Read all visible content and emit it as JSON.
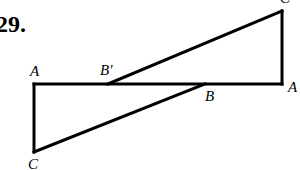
{
  "problem_number": "29.",
  "labels": {
    "a_left": "A",
    "b_prime": "B′",
    "c_top": "C",
    "b": "B",
    "a_right": "A",
    "c_bottom": "C"
  },
  "stroke_color": "#000000"
}
